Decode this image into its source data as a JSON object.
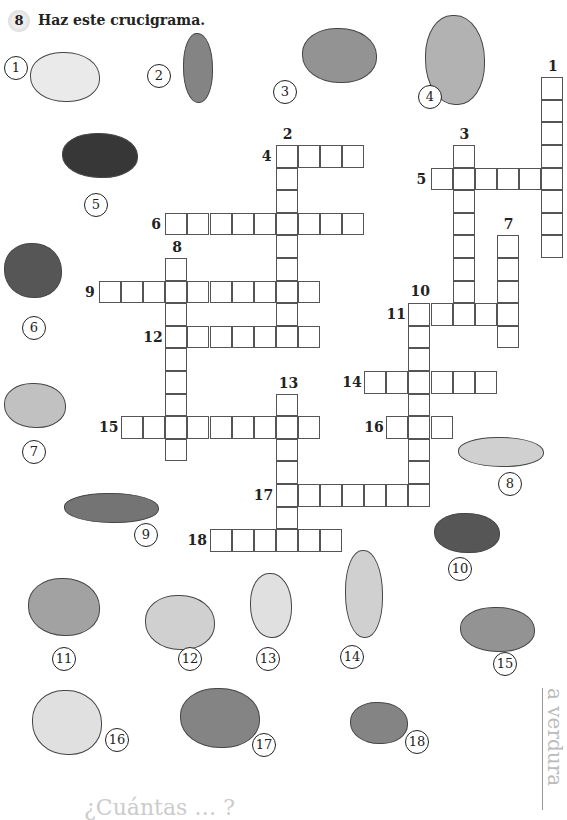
{
  "exercise": {
    "number": "8",
    "instruction": "Haz este crucigrama."
  },
  "grid": {
    "origin": [
      99,
      145
    ],
    "cell_w": 22.1,
    "cell_h": 22.6,
    "words": [
      {
        "num": "1",
        "dir": "down",
        "col": 20,
        "row": -3,
        "len": 8
      },
      {
        "num": "2",
        "dir": "down",
        "col": 8,
        "row": 0,
        "len": 9
      },
      {
        "num": "3",
        "dir": "down",
        "col": 16,
        "row": 0,
        "len": 8
      },
      {
        "num": "4",
        "dir": "across",
        "col": 8,
        "row": 0,
        "len": 4
      },
      {
        "num": "5",
        "dir": "across",
        "col": 15,
        "row": 1,
        "len": 6
      },
      {
        "num": "6",
        "dir": "across",
        "col": 3,
        "row": 3,
        "len": 9
      },
      {
        "num": "7",
        "dir": "down",
        "col": 18,
        "row": 4,
        "len": 5
      },
      {
        "num": "8",
        "dir": "down",
        "col": 3,
        "row": 5,
        "len": 9
      },
      {
        "num": "9",
        "dir": "across",
        "col": 0,
        "row": 6,
        "len": 10
      },
      {
        "num": "10",
        "dir": "down",
        "col": 14,
        "row": 7,
        "len": 9
      },
      {
        "num": "11",
        "dir": "across",
        "col": 14,
        "row": 7,
        "len": 5
      },
      {
        "num": "12",
        "dir": "across",
        "col": 3,
        "row": 8,
        "len": 7
      },
      {
        "num": "13",
        "dir": "down",
        "col": 8,
        "row": 11,
        "len": 7
      },
      {
        "num": "14",
        "dir": "across",
        "col": 12,
        "row": 10,
        "len": 6
      },
      {
        "num": "15",
        "dir": "across",
        "col": 1,
        "row": 12,
        "len": 9
      },
      {
        "num": "16",
        "dir": "across",
        "col": 13,
        "row": 12,
        "len": 3
      },
      {
        "num": "17",
        "dir": "across",
        "col": 8,
        "row": 15,
        "len": 7
      },
      {
        "num": "18",
        "dir": "across",
        "col": 5,
        "row": 17,
        "len": 6
      }
    ]
  },
  "pictures": [
    {
      "num": "1",
      "icon": "pepper-icon",
      "circle": [
        4,
        56
      ],
      "pic": [
        30,
        52,
        70,
        50
      ],
      "color": "#e8e8e8"
    },
    {
      "num": "2",
      "icon": "artichoke-icon",
      "circle": [
        147,
        64
      ],
      "pic": [
        183,
        33,
        30,
        70
      ],
      "color": "#777"
    },
    {
      "num": "3",
      "icon": "cauliflower-icon",
      "circle": [
        273,
        80
      ],
      "pic": [
        302,
        28,
        75,
        55
      ],
      "color": "#888"
    },
    {
      "num": "4",
      "icon": "celery-icon",
      "circle": [
        418,
        85
      ],
      "pic": [
        425,
        15,
        60,
        90
      ],
      "color": "#aaa"
    },
    {
      "num": "5",
      "icon": "tomato-icon",
      "circle": [
        84,
        193
      ],
      "pic": [
        62,
        133,
        76,
        45
      ],
      "color": "#222"
    },
    {
      "num": "6",
      "icon": "spinach-icon",
      "circle": [
        22,
        316
      ],
      "pic": [
        4,
        243,
        58,
        55
      ],
      "color": "#444"
    },
    {
      "num": "7",
      "icon": "mushroom-icon",
      "circle": [
        22,
        440
      ],
      "pic": [
        4,
        383,
        62,
        45
      ],
      "color": "#bbb"
    },
    {
      "num": "8",
      "icon": "carrot-icon",
      "circle": [
        498,
        472
      ],
      "pic": [
        458,
        437,
        86,
        30
      ],
      "color": "#ccc"
    },
    {
      "num": "9",
      "icon": "asparagus-icon",
      "circle": [
        134,
        523
      ],
      "pic": [
        64,
        493,
        95,
        30
      ],
      "color": "#666"
    },
    {
      "num": "10",
      "icon": "eggplant-icon",
      "circle": [
        448,
        557
      ],
      "pic": [
        434,
        513,
        66,
        40
      ],
      "color": "#444"
    },
    {
      "num": "11",
      "icon": "lettuce-icon",
      "circle": [
        52,
        647
      ],
      "pic": [
        28,
        578,
        72,
        58
      ],
      "color": "#999"
    },
    {
      "num": "12",
      "icon": "bean-pod-icon",
      "circle": [
        178,
        647
      ],
      "pic": [
        145,
        595,
        70,
        55
      ],
      "color": "#ccc"
    },
    {
      "num": "13",
      "icon": "onion-icon",
      "circle": [
        256,
        647
      ],
      "pic": [
        250,
        573,
        42,
        65
      ],
      "color": "#ddd"
    },
    {
      "num": "14",
      "icon": "leek-icon",
      "circle": [
        340,
        645
      ],
      "pic": [
        345,
        550,
        38,
        88
      ],
      "color": "#ccc"
    },
    {
      "num": "15",
      "icon": "peas-icon",
      "circle": [
        493,
        652
      ],
      "pic": [
        460,
        607,
        75,
        45
      ],
      "color": "#888"
    },
    {
      "num": "16",
      "icon": "garlic-icon",
      "circle": [
        105,
        728
      ],
      "pic": [
        32,
        690,
        70,
        65
      ],
      "color": "#ddd"
    },
    {
      "num": "17",
      "icon": "chard-icon",
      "circle": [
        252,
        733
      ],
      "pic": [
        180,
        688,
        80,
        60
      ],
      "color": "#777"
    },
    {
      "num": "18",
      "icon": "potato-icon",
      "circle": [
        405,
        730
      ],
      "pic": [
        350,
        702,
        58,
        42
      ],
      "color": "#777"
    }
  ],
  "side_label": "a verdura",
  "footer_text": "¿Cuántas … ?"
}
